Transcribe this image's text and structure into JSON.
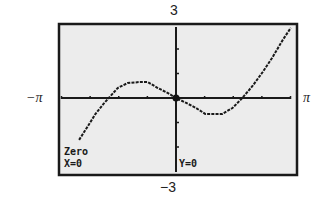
{
  "labels": {
    "ymax": "3",
    "ymin": "−3",
    "xmin": "−π",
    "xmax": "π"
  },
  "readout": {
    "mode": "Zero",
    "x": "X=0",
    "y": "Y=0"
  },
  "colors": {
    "screen_bg": "#ececec",
    "frame": "#1a1a1a",
    "curve": "#1a1a1a"
  },
  "chart_data": {
    "type": "line",
    "title": "",
    "xlabel": "",
    "ylabel": "",
    "xlim": [
      -3.1416,
      3.1416
    ],
    "ylim": [
      -3,
      3
    ],
    "xscale_tick": 0.7854,
    "yscale_tick": 1,
    "grid": false,
    "tick_labels": {
      "x_left": "−π",
      "x_right": "π",
      "y_top": "3",
      "y_bottom": "−3"
    },
    "annotation": {
      "mode": "Zero",
      "x": 0,
      "y": 0
    },
    "series": [
      {
        "name": "f(x)",
        "points_approx": [
          [
            -2.66,
            -1.71
          ],
          [
            -2.43,
            -1.18
          ],
          [
            -2.21,
            -0.65
          ],
          [
            -1.99,
            -0.24
          ],
          [
            -1.82,
            0.04
          ],
          [
            -1.6,
            0.41
          ],
          [
            -1.33,
            0.61
          ],
          [
            -1.02,
            0.65
          ],
          [
            -0.77,
            0.65
          ],
          [
            -0.5,
            0.41
          ],
          [
            -0.22,
            0.2
          ],
          [
            0.0,
            0.0
          ],
          [
            0.28,
            -0.2
          ],
          [
            0.55,
            -0.41
          ],
          [
            0.8,
            -0.65
          ],
          [
            1.27,
            -0.65
          ],
          [
            1.55,
            -0.41
          ],
          [
            1.82,
            0.0
          ],
          [
            2.1,
            0.49
          ],
          [
            2.38,
            1.06
          ],
          [
            2.65,
            1.67
          ],
          [
            2.93,
            2.37
          ],
          [
            3.15,
            2.86
          ]
        ],
        "zeros_approx": [
          -1.82,
          0,
          1.82
        ]
      }
    ]
  }
}
